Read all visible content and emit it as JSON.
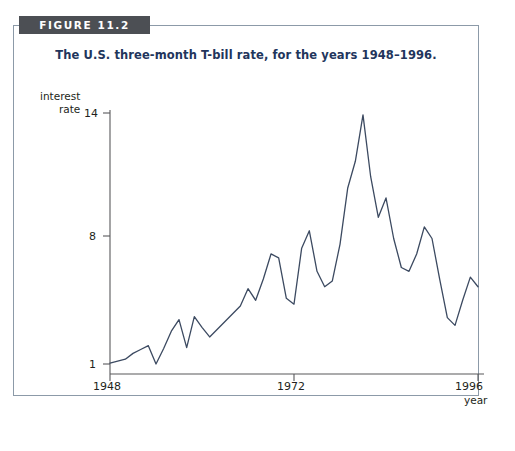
{
  "figure": {
    "banner_label": "FIGURE 11.2",
    "title": "The U.S. three-month T-bill rate, for the years 1948–1996.",
    "banner_color": "#4c4f54",
    "title_color": "#22355c",
    "frame_border_color": "#8c9aa8",
    "line_color": "#3c4a61"
  },
  "axes": {
    "y_label_line1": "interest",
    "y_label_line2": "rate",
    "y_ticks": [
      "14",
      "8",
      "1"
    ],
    "x_ticks": [
      "1948",
      "1972",
      "1996"
    ],
    "x_label": "year"
  },
  "chart_data": {
    "type": "line",
    "title": "The U.S. three-month T-bill rate, for the years 1948–1996.",
    "xlabel": "year",
    "ylabel": "interest rate",
    "xlim": [
      1948,
      1996
    ],
    "ylim": [
      1,
      14
    ],
    "grid": false,
    "legend": null,
    "y_tick_values": [
      1,
      8,
      14
    ],
    "x_tick_values": [
      1948,
      1972,
      1996
    ],
    "x": [
      1948,
      1949,
      1950,
      1951,
      1952,
      1953,
      1954,
      1955,
      1956,
      1957,
      1958,
      1959,
      1960,
      1961,
      1962,
      1963,
      1964,
      1965,
      1966,
      1967,
      1968,
      1969,
      1970,
      1971,
      1972,
      1973,
      1974,
      1975,
      1976,
      1977,
      1978,
      1979,
      1980,
      1981,
      1982,
      1983,
      1984,
      1985,
      1986,
      1987,
      1988,
      1989,
      1990,
      1991,
      1992,
      1993,
      1994,
      1995,
      1996
    ],
    "values": [
      1.05,
      1.15,
      1.25,
      1.55,
      1.75,
      1.95,
      1.0,
      1.8,
      2.7,
      3.3,
      1.85,
      3.45,
      2.9,
      2.4,
      2.8,
      3.2,
      3.6,
      4.0,
      4.9,
      4.3,
      5.4,
      6.7,
      6.5,
      4.4,
      4.1,
      7.0,
      7.9,
      5.8,
      5.0,
      5.3,
      7.2,
      10.1,
      11.5,
      13.9,
      10.7,
      8.6,
      9.6,
      7.5,
      6.0,
      5.8,
      6.7,
      8.1,
      7.5,
      5.4,
      3.4,
      3.0,
      4.3,
      5.5,
      5.0
    ]
  }
}
